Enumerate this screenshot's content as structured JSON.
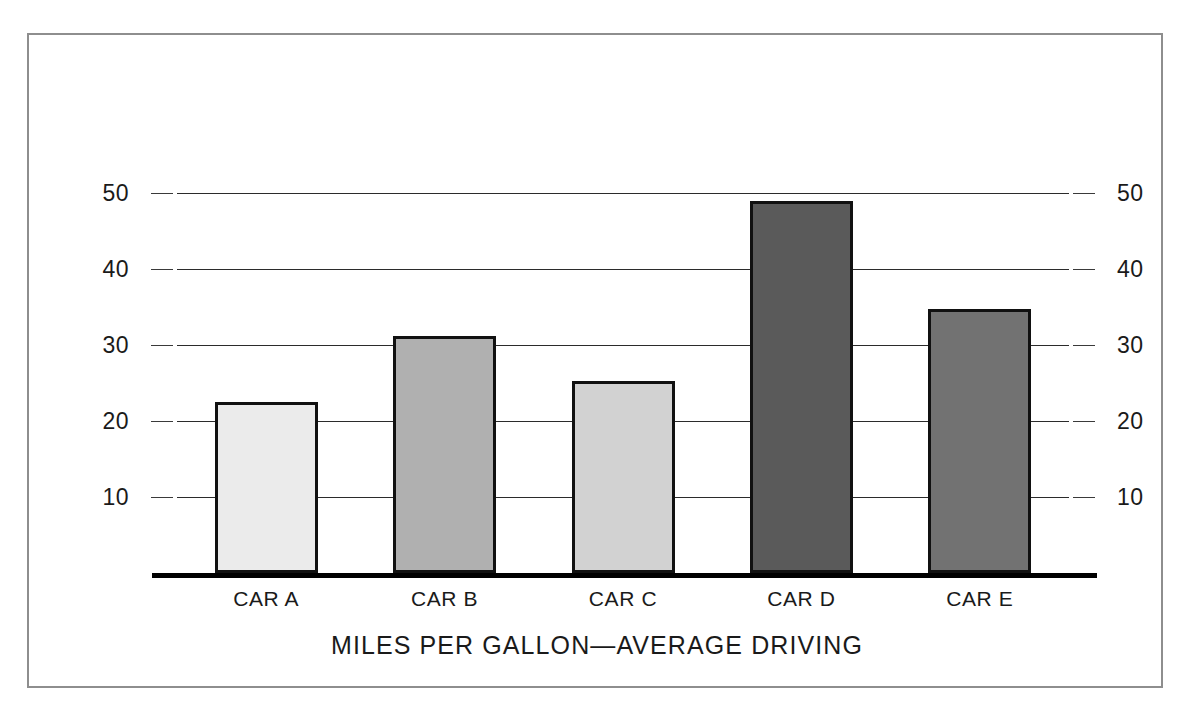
{
  "chart_data": {
    "type": "bar",
    "title": "MILES PER GALLON—AVERAGE DRIVING",
    "xlabel": "",
    "ylabel": "",
    "ylim": [
      0,
      55
    ],
    "grid": true,
    "legend": "none",
    "dual_axis": true,
    "categories": [
      "CAR A",
      "CAR B",
      "CAR C",
      "CAR D",
      "CAR E"
    ],
    "values": [
      22.5,
      31.2,
      25.3,
      49.0,
      34.8
    ],
    "bar_colors": [
      "#ebebeb",
      "#b0b0b0",
      "#d2d2d2",
      "#5a5a5a",
      "#727272"
    ],
    "bar_outline_color": "#111111",
    "yticks_left": [
      "50",
      "40",
      "30",
      "20",
      "10"
    ],
    "yticks_right": [
      "50",
      "40",
      "30",
      "20",
      "10"
    ],
    "ytick_values": [
      50,
      40,
      30,
      20,
      10
    ]
  },
  "figure": {
    "frame_color": "#8e8e8e",
    "background": "#ffffff",
    "axis_color": "#000000",
    "gridline_color": "#3a3a3a"
  }
}
